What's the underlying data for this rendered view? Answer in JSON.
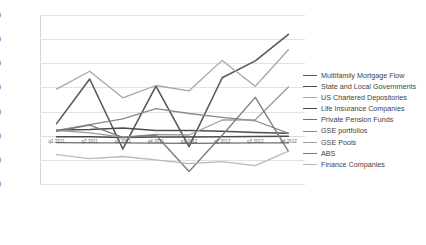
{
  "chart_data": {
    "type": "line",
    "title": "",
    "xlabel": "",
    "ylabel": "Axis Title",
    "ylim": [
      -20,
      50
    ],
    "yticks": [
      50,
      40,
      30,
      20,
      10,
      0,
      -10,
      -20
    ],
    "grid": true,
    "legend_position": "right",
    "categories": [
      "q1 2011",
      "q2 2011",
      "q3 2011",
      "q4 2011",
      "q1 2012",
      "q2 2012",
      "q3 2012",
      "q4 2012"
    ],
    "series": [
      {
        "name": "Multifamily Mortgage Flow",
        "color": "#595959",
        "width": 1.6,
        "values": [
          5.0,
          23.5,
          -5.5,
          20.5,
          -4.5,
          24.0,
          31.0,
          42.0
        ]
      },
      {
        "name": "State and Local Governments",
        "color": "#4d4d4d",
        "width": 1.5,
        "values": [
          2.4,
          2.6,
          3.2,
          2.2,
          2.2,
          1.8,
          1.3,
          1.0
        ]
      },
      {
        "name": "US Chartered Depositories",
        "color": "#a6a6a6",
        "width": 1.3,
        "values": [
          19.3,
          26.7,
          15.7,
          20.8,
          18.6,
          31.2,
          20.5,
          35.6
        ]
      },
      {
        "name": "Life Insurance Companies",
        "color": "#4a4a4a",
        "width": 1.5,
        "values": [
          -0.4,
          -0.4,
          -0.7,
          -0.5,
          -0.5,
          -0.4,
          -0.3,
          -0.2
        ]
      },
      {
        "name": "Private Pension Funds",
        "color": "#6e6e6e",
        "width": 1.3,
        "values": [
          -2.9,
          -3.0,
          -3.0,
          -3.1,
          -3.2,
          -3.1,
          -3.0,
          -3.0
        ]
      },
      {
        "name": "GSE portfolios",
        "color": "#8a8a8a",
        "width": 1.3,
        "values": [
          2.2,
          4.6,
          7.0,
          11.2,
          9.2,
          7.6,
          6.2,
          1.0
        ]
      },
      {
        "name": "GSE Pools",
        "color": "#9b9b9b",
        "width": 1.3,
        "values": [
          2.2,
          1.2,
          -0.6,
          0.5,
          0.3,
          6.5,
          6.6,
          20.2
        ]
      },
      {
        "name": "ABS",
        "color": "#7a7a7a",
        "width": 1.3,
        "values": [
          1.8,
          4.4,
          -0.7,
          0.2,
          -14.8,
          0.2,
          15.9,
          -6.5
        ]
      },
      {
        "name": "Finance Companies",
        "color": "#b8b8b8",
        "width": 1.3,
        "values": [
          -7.8,
          -9.5,
          -8.6,
          -10.0,
          -11.6,
          -10.7,
          -12.4,
          -6.4
        ]
      }
    ]
  },
  "axis": {
    "y_title": "Axis Title"
  }
}
